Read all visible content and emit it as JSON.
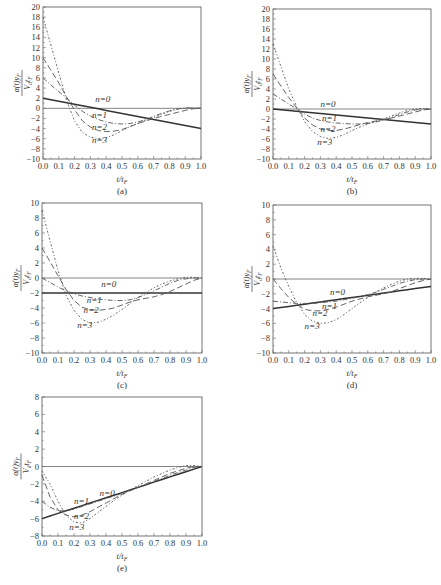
{
  "figure": {
    "panels_count": 5
  },
  "chart_data": [
    {
      "id": "a",
      "type": "line",
      "panel_label": "(a)",
      "xlabel": "t/t_F",
      "xlabel_display": "t/t",
      "xlabel_sub": "F",
      "ylabel": "α(t)y_F / (V_d t_F)",
      "xlim": [
        0.0,
        1.0
      ],
      "ylim": [
        -10,
        20
      ],
      "xticks": [
        "0.0",
        "0.1",
        "0.2",
        "0.3",
        "0.4",
        "0.5",
        "0.6",
        "0.7",
        "0.8",
        "0.9",
        "1.0"
      ],
      "yticks": [
        20,
        18,
        16,
        14,
        12,
        10,
        8,
        6,
        4,
        2,
        0,
        -2,
        -4,
        -6,
        -8,
        -10
      ],
      "frame": {
        "x0": 43,
        "y0": 7,
        "x1": 201,
        "y1": 159
      },
      "x": [
        0.0,
        0.05,
        0.1,
        0.15,
        0.2,
        0.25,
        0.3,
        0.35,
        0.4,
        0.45,
        0.5,
        0.55,
        0.6,
        0.65,
        0.7,
        0.75,
        0.8,
        0.85,
        0.9,
        0.95,
        1.0
      ],
      "series": [
        {
          "name": "n=0",
          "values": [
            2.0,
            1.7,
            1.4,
            1.1,
            0.8,
            0.5,
            0.2,
            -0.1,
            -0.4,
            -0.7,
            -1.0,
            -1.3,
            -1.6,
            -1.9,
            -2.2,
            -2.5,
            -2.8,
            -3.1,
            -3.4,
            -3.7,
            -4.0
          ]
        },
        {
          "name": "n=1",
          "values": [
            6.0,
            4.6,
            3.3,
            2.0,
            0.6,
            -0.6,
            -1.5,
            -2.2,
            -2.7,
            -3.0,
            -3.1,
            -3.0,
            -2.7,
            -2.2,
            -1.6,
            -1.0,
            -0.5,
            -0.1,
            0.1,
            0.1,
            0.0
          ]
        },
        {
          "name": "n=2",
          "values": [
            10.0,
            7.5,
            5.0,
            2.2,
            -0.3,
            -2.5,
            -3.7,
            -4.4,
            -4.6,
            -4.5,
            -4.2,
            -3.6,
            -3.0,
            -2.5,
            -2.0,
            -1.6,
            -1.2,
            -0.8,
            -0.4,
            -0.1,
            0.0
          ]
        },
        {
          "name": "n=3",
          "values": [
            18.0,
            12.5,
            7.0,
            1.5,
            -2.5,
            -4.8,
            -5.7,
            -6.0,
            -5.8,
            -5.2,
            -4.4,
            -3.6,
            -3.0,
            -2.4,
            -1.8,
            -1.2,
            -0.6,
            -0.2,
            0.0,
            0.1,
            0.0
          ]
        }
      ],
      "annotations": [
        {
          "text": "n=0",
          "x": 0.33,
          "y": 1.3
        },
        {
          "text": "n=1",
          "x": 0.31,
          "y": -1.9
        },
        {
          "text": "n=2",
          "x": 0.31,
          "y": -4.2
        },
        {
          "text": "n=3",
          "x": 0.31,
          "y": -6.8
        }
      ]
    },
    {
      "id": "b",
      "type": "line",
      "panel_label": "(b)",
      "xlabel": "t/t_F",
      "xlabel_display": "t/t",
      "xlabel_sub": "F",
      "ylabel": "α(t)y_F / (V_d t_F)",
      "xlim": [
        0.0,
        1.0
      ],
      "ylim": [
        -10,
        20
      ],
      "xticks": [
        "0.0",
        "0.1",
        "0.2",
        "0.3",
        "0.4",
        "0.5",
        "0.6",
        "0.7",
        "0.8",
        "0.9",
        "1.0"
      ],
      "yticks": [
        20,
        18,
        16,
        14,
        12,
        10,
        8,
        6,
        4,
        2,
        0,
        -2,
        -4,
        -6,
        -8,
        -10
      ],
      "frame": {
        "x0": 273,
        "y0": 9,
        "x1": 431,
        "y1": 159
      },
      "x": [
        0.0,
        0.05,
        0.1,
        0.15,
        0.2,
        0.25,
        0.3,
        0.35,
        0.4,
        0.45,
        0.5,
        0.55,
        0.6,
        0.65,
        0.7,
        0.75,
        0.8,
        0.85,
        0.9,
        0.95,
        1.0
      ],
      "series": [
        {
          "name": "n=0",
          "values": [
            0.0,
            -0.15,
            -0.3,
            -0.45,
            -0.6,
            -0.75,
            -0.9,
            -1.05,
            -1.2,
            -1.35,
            -1.5,
            -1.65,
            -1.8,
            -1.95,
            -2.1,
            -2.25,
            -2.4,
            -2.55,
            -2.7,
            -2.85,
            -3.0
          ]
        },
        {
          "name": "n=1",
          "values": [
            3.0,
            2.0,
            1.0,
            0.0,
            -1.0,
            -1.8,
            -2.3,
            -2.6,
            -2.8,
            -2.9,
            -3.0,
            -3.0,
            -2.9,
            -2.6,
            -2.2,
            -1.7,
            -1.1,
            -0.6,
            -0.2,
            0.0,
            0.0
          ]
        },
        {
          "name": "n=2",
          "values": [
            7.0,
            4.6,
            2.3,
            0.2,
            -1.8,
            -3.2,
            -4.0,
            -4.3,
            -4.3,
            -4.0,
            -3.6,
            -3.1,
            -2.7,
            -2.4,
            -2.1,
            -1.8,
            -1.4,
            -1.0,
            -0.6,
            -0.2,
            0.0
          ]
        },
        {
          "name": "n=3",
          "values": [
            13.0,
            8.5,
            4.0,
            0.5,
            -2.5,
            -4.5,
            -5.5,
            -5.9,
            -5.7,
            -5.1,
            -4.3,
            -3.6,
            -3.0,
            -2.5,
            -2.0,
            -1.4,
            -0.8,
            -0.3,
            0.0,
            0.1,
            0.0
          ]
        }
      ],
      "annotations": [
        {
          "text": "n=0",
          "x": 0.3,
          "y": 0.5
        },
        {
          "text": "n=1",
          "x": 0.31,
          "y": -2.4
        },
        {
          "text": "n=2",
          "x": 0.3,
          "y": -4.6
        },
        {
          "text": "n=3",
          "x": 0.28,
          "y": -7.2
        }
      ]
    },
    {
      "id": "c",
      "type": "line",
      "panel_label": "(c)",
      "xlabel": "t/t_F",
      "xlabel_display": "t/t",
      "xlabel_sub": "F",
      "ylabel": "α(t)y_F / (V_d t_F)",
      "xlim": [
        0.0,
        1.0
      ],
      "ylim": [
        -10,
        10
      ],
      "xticks": [
        "0.0",
        "0.1",
        "0.2",
        "0.3",
        "0.4",
        "0.5",
        "0.6",
        "0.7",
        "0.8",
        "0.9",
        "1.0"
      ],
      "yticks": [
        10,
        8,
        6,
        4,
        2,
        0,
        -2,
        -4,
        -6,
        -8,
        -10
      ],
      "frame": {
        "x0": 42,
        "y0": 203,
        "x1": 202,
        "y1": 353
      },
      "x": [
        0.0,
        0.05,
        0.1,
        0.15,
        0.2,
        0.25,
        0.3,
        0.35,
        0.4,
        0.45,
        0.5,
        0.55,
        0.6,
        0.65,
        0.7,
        0.75,
        0.8,
        0.85,
        0.9,
        0.95,
        1.0
      ],
      "series": [
        {
          "name": "n=0",
          "values": [
            -2.0,
            -2.0,
            -2.0,
            -2.0,
            -2.0,
            -2.0,
            -2.0,
            -2.0,
            -2.0,
            -2.0,
            -2.0,
            -2.0,
            -2.0,
            -2.0,
            -2.0,
            -2.0,
            -2.0,
            -2.0,
            -2.0,
            -2.0,
            -2.0
          ]
        },
        {
          "name": "n=1",
          "values": [
            0.0,
            -0.6,
            -1.2,
            -1.7,
            -2.1,
            -2.4,
            -2.6,
            -2.8,
            -2.9,
            -3.0,
            -3.0,
            -2.9,
            -2.6,
            -2.2,
            -1.7,
            -1.2,
            -0.7,
            -0.3,
            -0.1,
            0.0,
            0.0
          ]
        },
        {
          "name": "n=2",
          "values": [
            4.0,
            2.2,
            0.3,
            -1.5,
            -3.0,
            -3.9,
            -4.2,
            -4.3,
            -4.2,
            -4.0,
            -3.6,
            -3.2,
            -2.9,
            -2.7,
            -2.5,
            -2.2,
            -1.8,
            -1.3,
            -0.8,
            -0.3,
            0.0
          ]
        },
        {
          "name": "n=3",
          "values": [
            9.0,
            5.0,
            1.0,
            -2.3,
            -4.3,
            -5.5,
            -6.0,
            -5.9,
            -5.5,
            -4.9,
            -4.2,
            -3.4,
            -2.6,
            -1.9,
            -1.3,
            -0.8,
            -0.4,
            -0.1,
            0.1,
            0.1,
            0.0
          ]
        }
      ],
      "annotations": [
        {
          "text": "n=0",
          "x": 0.37,
          "y": -1.2
        },
        {
          "text": "n=1",
          "x": 0.28,
          "y": -3.3
        },
        {
          "text": "n=2",
          "x": 0.26,
          "y": -4.6
        },
        {
          "text": "n=3",
          "x": 0.22,
          "y": -6.6
        }
      ]
    },
    {
      "id": "d",
      "type": "line",
      "panel_label": "(d)",
      "xlabel": "t/t_F",
      "xlabel_display": "t/t",
      "xlabel_sub": "F",
      "ylabel": "α(t)y_F / (V_d t_F)",
      "xlim": [
        0.0,
        1.0
      ],
      "ylim": [
        -10,
        10
      ],
      "xticks": [
        "0.0",
        "0.1",
        "0.2",
        "0.3",
        "0.4",
        "0.5",
        "0.6",
        "0.7",
        "0.8",
        "0.9",
        "1.0"
      ],
      "yticks": [
        10,
        8,
        6,
        4,
        2,
        0,
        -2,
        -4,
        -6,
        -8,
        -10
      ],
      "frame": {
        "x0": 273,
        "y0": 205,
        "x1": 431,
        "y1": 353
      },
      "x": [
        0.0,
        0.05,
        0.1,
        0.15,
        0.2,
        0.25,
        0.3,
        0.35,
        0.4,
        0.45,
        0.5,
        0.55,
        0.6,
        0.65,
        0.7,
        0.75,
        0.8,
        0.85,
        0.9,
        0.95,
        1.0
      ],
      "series": [
        {
          "name": "n=0",
          "values": [
            -4.0,
            -3.85,
            -3.7,
            -3.55,
            -3.4,
            -3.25,
            -3.1,
            -2.95,
            -2.8,
            -2.65,
            -2.5,
            -2.35,
            -2.2,
            -2.05,
            -1.9,
            -1.75,
            -1.6,
            -1.45,
            -1.3,
            -1.15,
            -1.0
          ]
        },
        {
          "name": "n=1",
          "values": [
            -3.0,
            -3.1,
            -3.2,
            -3.3,
            -3.3,
            -3.3,
            -3.2,
            -3.1,
            -3.0,
            -2.8,
            -2.6,
            -2.4,
            -2.1,
            -1.8,
            -1.4,
            -1.0,
            -0.6,
            -0.3,
            -0.1,
            0.0,
            0.0
          ]
        },
        {
          "name": "n=2",
          "values": [
            0.0,
            -1.3,
            -2.5,
            -3.4,
            -4.1,
            -4.3,
            -4.3,
            -4.1,
            -3.8,
            -3.4,
            -3.0,
            -2.7,
            -2.4,
            -2.2,
            -2.0,
            -1.7,
            -1.3,
            -0.9,
            -0.5,
            -0.2,
            0.0
          ]
        },
        {
          "name": "n=3",
          "values": [
            4.5,
            1.5,
            -1.0,
            -3.2,
            -4.8,
            -5.7,
            -6.0,
            -5.9,
            -5.5,
            -4.8,
            -4.0,
            -3.2,
            -2.5,
            -1.8,
            -1.2,
            -0.7,
            -0.3,
            0.0,
            0.1,
            0.1,
            0.0
          ]
        }
      ],
      "annotations": [
        {
          "text": "n=0",
          "x": 0.36,
          "y": -2.2
        },
        {
          "text": "n=1",
          "x": 0.31,
          "y": -4.0
        },
        {
          "text": "n=2",
          "x": 0.25,
          "y": -5.0
        },
        {
          "text": "n=3",
          "x": 0.2,
          "y": -6.8
        }
      ]
    },
    {
      "id": "e",
      "type": "line",
      "panel_label": "(e)",
      "xlabel": "t/t_F",
      "xlabel_display": "t/t",
      "xlabel_sub": "F",
      "ylabel": "α(t)y_F / (V_d t_F)",
      "xlim": [
        0.0,
        1.0
      ],
      "ylim": [
        -8,
        8
      ],
      "xticks": [
        "0.0",
        "0.1",
        "0.2",
        "0.3",
        "0.4",
        "0.5",
        "0.6",
        "0.7",
        "0.8",
        "0.9",
        "1.0"
      ],
      "yticks": [
        8,
        6,
        4,
        2,
        0,
        -2,
        -4,
        -6,
        -8
      ],
      "frame": {
        "x0": 42,
        "y0": 397,
        "x1": 202,
        "y1": 536
      },
      "x": [
        0.0,
        0.05,
        0.1,
        0.15,
        0.2,
        0.25,
        0.3,
        0.35,
        0.4,
        0.45,
        0.5,
        0.55,
        0.6,
        0.65,
        0.7,
        0.75,
        0.8,
        0.85,
        0.9,
        0.95,
        1.0
      ],
      "series": [
        {
          "name": "n=0",
          "values": [
            -6.0,
            -5.7,
            -5.4,
            -5.1,
            -4.8,
            -4.5,
            -4.2,
            -3.9,
            -3.6,
            -3.3,
            -3.0,
            -2.7,
            -2.4,
            -2.1,
            -1.8,
            -1.5,
            -1.2,
            -0.9,
            -0.6,
            -0.3,
            0.0
          ]
        },
        {
          "name": "n=1",
          "values": [
            -4.0,
            -4.7,
            -5.1,
            -5.1,
            -4.9,
            -4.6,
            -4.3,
            -4.0,
            -3.7,
            -3.4,
            -3.1,
            -2.7,
            -2.4,
            -2.1,
            -1.7,
            -1.4,
            -1.0,
            -0.7,
            -0.4,
            -0.1,
            0.0
          ]
        },
        {
          "name": "n=2",
          "values": [
            -1.0,
            -3.5,
            -5.0,
            -5.6,
            -5.8,
            -5.6,
            -5.2,
            -4.7,
            -4.2,
            -3.7,
            -3.2,
            -2.8,
            -2.4,
            -2.0,
            -1.6,
            -1.2,
            -0.8,
            -0.5,
            -0.2,
            0.0,
            0.0
          ]
        },
        {
          "name": "n=3",
          "values": [
            -0.5,
            -2.0,
            -4.0,
            -5.6,
            -6.4,
            -6.5,
            -6.0,
            -5.3,
            -4.6,
            -3.9,
            -3.3,
            -2.7,
            -2.2,
            -1.7,
            -1.2,
            -0.8,
            -0.4,
            -0.1,
            0.1,
            0.1,
            0.0
          ]
        }
      ],
      "annotations": [
        {
          "text": "n=0",
          "x": 0.36,
          "y": -3.4
        },
        {
          "text": "n=1",
          "x": 0.2,
          "y": -4.3
        },
        {
          "text": "n=2",
          "x": 0.2,
          "y": -6.1
        },
        {
          "text": "n=3",
          "x": 0.17,
          "y": -7.3
        }
      ]
    }
  ]
}
